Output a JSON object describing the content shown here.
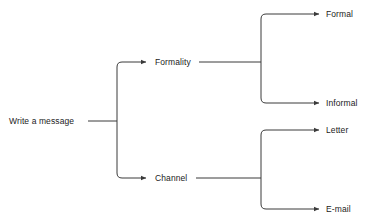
{
  "diagram": {
    "background_color": "#ffffff",
    "line_color": "#3a3a3a",
    "text_color": "#222222",
    "nodes": {
      "root": "Write a message",
      "level1": [
        {
          "label": "Formality"
        },
        {
          "label": "Channel"
        }
      ],
      "level2": [
        {
          "label": "Formal"
        },
        {
          "label": "Informal"
        },
        {
          "label": "Letter"
        },
        {
          "label": "E-mail"
        }
      ]
    },
    "edges": [
      {
        "from": "Write a message",
        "to": "Formality"
      },
      {
        "from": "Write a message",
        "to": "Channel"
      },
      {
        "from": "Formality",
        "to": "Formal"
      },
      {
        "from": "Formality",
        "to": "Informal"
      },
      {
        "from": "Channel",
        "to": "Letter"
      },
      {
        "from": "Channel",
        "to": "E-mail"
      }
    ]
  }
}
